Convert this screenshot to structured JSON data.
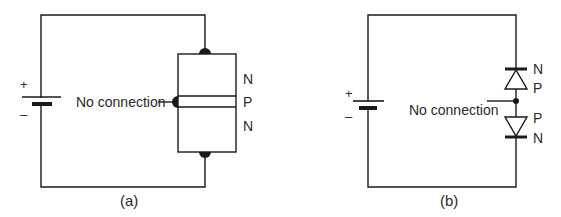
{
  "diagram": {
    "panel_a": {
      "caption": "(a)",
      "battery": {
        "plus": "+",
        "minus": "–"
      },
      "no_connection_label": "No connection",
      "layers": [
        "N",
        "P",
        "N"
      ]
    },
    "panel_b": {
      "caption": "(b)",
      "battery": {
        "plus": "+",
        "minus": "–"
      },
      "no_connection_label": "No connection",
      "diode_labels": [
        "N",
        "P",
        "P",
        "N"
      ]
    },
    "colors": {
      "line": "#1a1a1a",
      "text": "#2a2a2a",
      "background": "#ffffff"
    }
  }
}
